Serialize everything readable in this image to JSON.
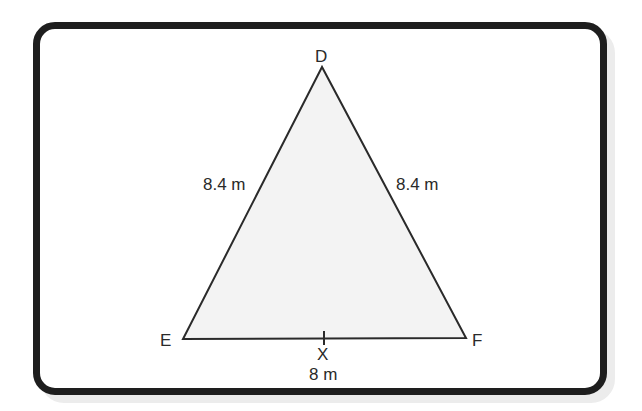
{
  "figure": {
    "type": "triangle",
    "vertices": {
      "D": {
        "label": "D"
      },
      "E": {
        "label": "E"
      },
      "F": {
        "label": "F"
      }
    },
    "sides": {
      "DE": "8.4 m",
      "DF": "8.4 m",
      "EF": "8 m"
    },
    "midpoint_label": "X",
    "colors": {
      "frame": "#1e1e1e",
      "triangle_fill": "#f3f3f3",
      "stroke": "#2a2a2a",
      "shadow": "#ececec"
    }
  }
}
